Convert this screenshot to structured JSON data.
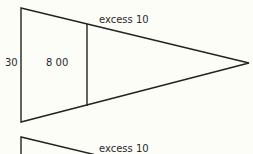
{
  "diagram": {
    "figures": [
      {
        "id": "funnel-1",
        "shape": "triangle-with-divider",
        "labels": {
          "left_side": "30",
          "inner_section": "8 00",
          "top_edge": "excess 10"
        }
      },
      {
        "id": "funnel-2",
        "shape": "triangle-partial",
        "labels": {
          "top_edge": "excess 10"
        }
      }
    ],
    "colors": {
      "background": "#fdfdf8",
      "line": "#222222",
      "text": "#2a2a2a"
    }
  }
}
